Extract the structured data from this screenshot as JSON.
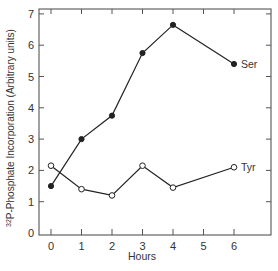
{
  "chart_data": {
    "type": "line",
    "title": "",
    "xlabel": "Hours",
    "ylabel": "32P-Phosphate Incorporation (Arbitrary units)",
    "ylabel_superscript": "32",
    "ylabel_main": "P-Phosphate Incorporation  (Arbitrary units)",
    "x_ticks": [
      0,
      1,
      2,
      3,
      4,
      5,
      6
    ],
    "y_ticks": [
      0,
      1,
      2,
      3,
      4,
      5,
      6,
      7
    ],
    "xlim": [
      -0.4,
      7.2
    ],
    "ylim": [
      0,
      7.2
    ],
    "grid": false,
    "legend": "inline labels at line ends",
    "series": [
      {
        "name": "Ser",
        "marker": "filled-circle",
        "x": [
          0,
          1,
          2,
          3,
          4,
          6
        ],
        "values": [
          1.5,
          3.0,
          3.75,
          5.75,
          6.65,
          5.4
        ]
      },
      {
        "name": "Tyr",
        "marker": "open-circle",
        "x": [
          0,
          1,
          2,
          3,
          4,
          6
        ],
        "values": [
          2.15,
          1.4,
          1.2,
          2.15,
          1.45,
          2.1
        ]
      }
    ]
  },
  "colors": {
    "line": "#222222",
    "axis": "#555555",
    "background": "#ffffff"
  }
}
